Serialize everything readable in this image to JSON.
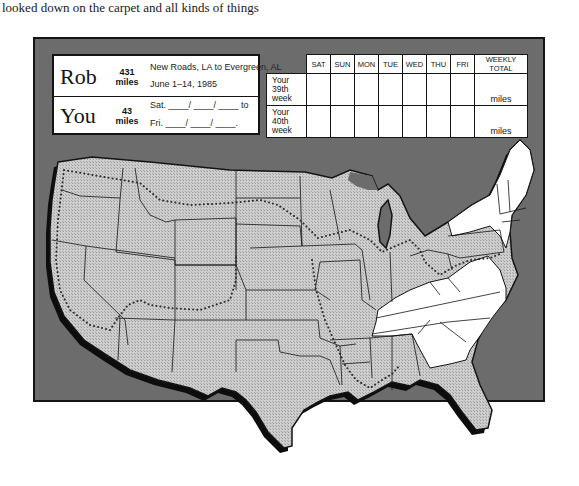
{
  "caption": "looked down on the carpet and all kinds of things",
  "tracker": {
    "rob": {
      "name": "Rob",
      "miles_value": "431",
      "miles_unit": "miles",
      "route": "New Roads, LA to Evergreen, AL",
      "dates": "June 1–14, 1985"
    },
    "you": {
      "name": "You",
      "miles_value": "43",
      "miles_unit": "miles",
      "start_line": "Sat. ____/ ____/ ____ to",
      "end_line": "Fri. ____/ ____/ ____."
    }
  },
  "week_table": {
    "columns": [
      "SAT",
      "SUN",
      "MON",
      "TUE",
      "WED",
      "THU",
      "FRI",
      "WEEKLY TOTAL"
    ],
    "rows": [
      {
        "label_lines": [
          "Your",
          "39th",
          "week"
        ],
        "total_unit": "miles"
      },
      {
        "label_lines": [
          "Your",
          "40th",
          "week"
        ],
        "total_unit": "miles"
      }
    ]
  },
  "map": {
    "title": "United States route map",
    "colors": {
      "frame_background": "#6c6c6c",
      "visited_states_fill": "#c4c4c4",
      "unvisited_states_fill": "#ffffff",
      "outline": "#141414",
      "route_dots": "#3a3a3a"
    },
    "white_states": [
      "New York",
      "Vermont",
      "New Hampshire",
      "Maine",
      "Massachusetts",
      "Connecticut",
      "Rhode Island",
      "Kentucky",
      "Tennessee",
      "Virginia",
      "North Carolina",
      "South Carolina",
      "Georgia"
    ],
    "route_description": "dotted route loop around the contiguous US"
  }
}
